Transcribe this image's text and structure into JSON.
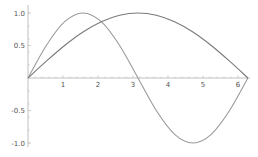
{
  "chart_data": {
    "type": "line",
    "title": "",
    "xlabel": "",
    "ylabel": "",
    "xlim": [
      0,
      6.283
    ],
    "ylim": [
      -1.0,
      1.0
    ],
    "grid": false,
    "legend": null,
    "x_ticks": [
      "1",
      "2",
      "3",
      "4",
      "5",
      "6"
    ],
    "y_ticks": [
      "1.0",
      "0.5",
      "-0.5",
      "-1.0"
    ],
    "series": [
      {
        "name": "sin(x)",
        "color": "#9a9a9a",
        "x": [
          0,
          0.5236,
          1.0472,
          1.5708,
          2.0944,
          2.618,
          3.1416,
          3.6652,
          4.1888,
          4.7124,
          5.236,
          5.7596,
          6.2832
        ],
        "y": [
          0,
          0.5,
          0.866,
          1.0,
          0.866,
          0.5,
          0,
          -0.5,
          -0.866,
          -1.0,
          -0.866,
          -0.5,
          0
        ]
      },
      {
        "name": "sin(x/2)",
        "color": "#7a7a7a",
        "x": [
          0,
          0.5236,
          1.0472,
          1.5708,
          2.0944,
          2.618,
          3.1416,
          3.6652,
          4.1888,
          4.7124,
          5.236,
          5.7596,
          6.2832
        ],
        "y": [
          0,
          0.2588,
          0.5,
          0.7071,
          0.866,
          0.9659,
          1.0,
          0.9659,
          0.866,
          0.7071,
          0.5,
          0.2588,
          0
        ]
      }
    ]
  },
  "axes": {
    "color": "#b0b0b0",
    "origin_px": [
      28,
      78
    ],
    "x_scale_px": 35,
    "y_scale_px": 65
  }
}
